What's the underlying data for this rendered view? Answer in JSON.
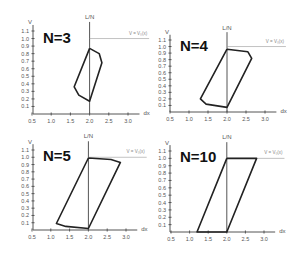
{
  "chart_data": [
    {
      "type": "line",
      "title": "N=3",
      "xlabel": "dx",
      "ylabel": "V",
      "x_ticks": [
        "0.5",
        "1.0",
        "1.5",
        "2.0",
        "2.5",
        "3.0"
      ],
      "y_ticks": [
        "0.1",
        "0.2",
        "0.3",
        "0.4",
        "0.5",
        "0.6",
        "0.7",
        "0.8",
        "0.9",
        "1.0",
        "1.1"
      ],
      "xlim": [
        0.5,
        3.2
      ],
      "ylim": [
        0,
        1.15
      ],
      "annotations": [
        "L/N",
        "V = V0(x)"
      ],
      "reference_lines": {
        "vertical_x": 2.0,
        "horizontal_y": 1.0
      },
      "series": [
        {
          "name": "hysteresis loop N=3",
          "points": [
            [
              2.0,
              0.87
            ],
            [
              2.25,
              0.8
            ],
            [
              2.32,
              0.68
            ],
            [
              2.0,
              0.17
            ],
            [
              1.72,
              0.25
            ],
            [
              1.6,
              0.36
            ],
            [
              2.0,
              0.87
            ]
          ]
        }
      ]
    },
    {
      "type": "line",
      "title": "N=4",
      "xlabel": "dx",
      "ylabel": "V",
      "x_ticks": [
        "0.5",
        "1.0",
        "1.5",
        "2.0",
        "2.5",
        "3.0"
      ],
      "y_ticks": [
        "0.1",
        "0.2",
        "0.3",
        "0.4",
        "0.5",
        "0.6",
        "0.7",
        "0.8",
        "0.9",
        "1.0",
        "1.1"
      ],
      "xlim": [
        0.5,
        3.2
      ],
      "ylim": [
        0,
        1.15
      ],
      "annotations": [
        "L/N",
        "V = V0(x)"
      ],
      "reference_lines": {
        "vertical_x": 2.0,
        "horizontal_y": 1.0
      },
      "series": [
        {
          "name": "hysteresis loop N=4",
          "points": [
            [
              2.0,
              0.96
            ],
            [
              2.55,
              0.92
            ],
            [
              2.65,
              0.82
            ],
            [
              2.0,
              0.07
            ],
            [
              1.45,
              0.12
            ],
            [
              1.3,
              0.2
            ],
            [
              2.0,
              0.96
            ]
          ]
        }
      ]
    },
    {
      "type": "line",
      "title": "N=5",
      "xlabel": "dx",
      "ylabel": "V",
      "x_ticks": [
        "0.5",
        "1.0",
        "1.5",
        "2.0",
        "2.5",
        "3.0"
      ],
      "y_ticks": [
        "0.1",
        "0.2",
        "0.3",
        "0.4",
        "0.5",
        "0.6",
        "0.7",
        "0.8",
        "0.9",
        "1.0",
        "1.1"
      ],
      "xlim": [
        0.5,
        3.2
      ],
      "ylim": [
        0,
        1.15
      ],
      "annotations": [
        "L/N",
        "V = V0(x)"
      ],
      "reference_lines": {
        "vertical_x": 2.0,
        "horizontal_y": 1.0
      },
      "series": [
        {
          "name": "hysteresis loop N=5",
          "points": [
            [
              2.0,
              0.99
            ],
            [
              2.6,
              0.97
            ],
            [
              2.85,
              0.93
            ],
            [
              2.0,
              0.02
            ],
            [
              1.4,
              0.05
            ],
            [
              1.15,
              0.09
            ],
            [
              2.0,
              0.99
            ]
          ]
        }
      ]
    },
    {
      "type": "line",
      "title": "N=10",
      "xlabel": "dx",
      "ylabel": "V",
      "x_ticks": [
        "0.5",
        "1.0",
        "1.5",
        "2.0",
        "2.5",
        "3.0"
      ],
      "y_ticks": [
        "0.1",
        "0.2",
        "0.3",
        "0.4",
        "0.5",
        "0.6",
        "0.7",
        "0.8",
        "0.9",
        "1.0",
        "1.1"
      ],
      "xlim": [
        0.5,
        3.2
      ],
      "ylim": [
        0,
        1.15
      ],
      "annotations": [
        "L/N",
        "V = V0(x)"
      ],
      "reference_lines": {
        "vertical_x": 2.0,
        "horizontal_y": 1.0
      },
      "series": [
        {
          "name": "hysteresis loop N=10",
          "points": [
            [
              2.0,
              1.0
            ],
            [
              2.8,
              1.0
            ],
            [
              2.0,
              0.0
            ],
            [
              1.2,
              0.0
            ],
            [
              2.0,
              1.0
            ]
          ]
        }
      ]
    }
  ],
  "panels": [
    {
      "title": "N=3",
      "x_label": "dx",
      "y_label": "V",
      "vline_label": "L/N",
      "hline_label": "V = V₀(x)"
    },
    {
      "title": "N=4",
      "x_label": "dx",
      "y_label": "V",
      "vline_label": "L/N",
      "hline_label": "V = V₀(x)"
    },
    {
      "title": "N=5",
      "x_label": "dx",
      "y_label": "V",
      "vline_label": "L/N",
      "hline_label": "V = V₀(x)"
    },
    {
      "title": "N=10",
      "x_label": "dx",
      "y_label": "V",
      "vline_label": "L/N",
      "hline_label": "V = V₀(x)"
    }
  ],
  "layout": [
    {
      "ox": 33,
      "oy": 114,
      "x05": 32,
      "x30": 128,
      "y11": 31
    },
    {
      "ox": 170,
      "oy": 112,
      "x05": 170,
      "x30": 265,
      "y11": 40
    },
    {
      "ox": 33,
      "oy": 230,
      "x05": 32,
      "x30": 126,
      "y11": 150
    },
    {
      "ox": 170,
      "oy": 232,
      "x05": 171,
      "x30": 264,
      "y11": 151
    }
  ]
}
